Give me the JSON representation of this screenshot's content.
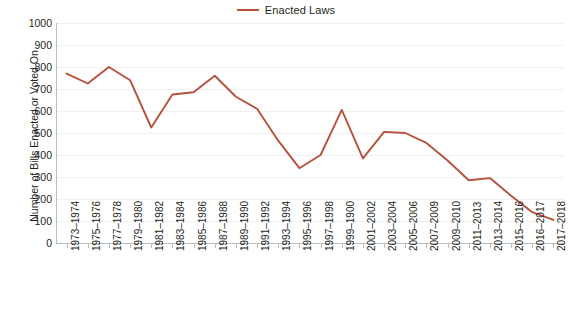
{
  "legend": {
    "entries": [
      {
        "label": "Enacted Laws",
        "color": "#b5513c",
        "marker": "line-swatch"
      }
    ],
    "position": "top-center"
  },
  "axes": {
    "y_title": "Number of Bills Enacted or Voted On",
    "x_title": "",
    "y_ticks": [
      "0",
      "100",
      "200",
      "300",
      "400",
      "500",
      "600",
      "700",
      "800",
      "900",
      "1000"
    ]
  },
  "chart_data": {
    "type": "line",
    "title": "",
    "subtitle": "",
    "xlabel": "",
    "ylabel": "Number of Bills Enacted or Voted On",
    "ylim": [
      0,
      1000
    ],
    "ytick_step": 100,
    "grid": true,
    "legend_position": "top-center",
    "categories": [
      "1973–1974",
      "1975–1976",
      "1977–1978",
      "1979–1980",
      "1981–1982",
      "1983–1984",
      "1985–1986",
      "1987–1988",
      "1989–1990",
      "1991–1992",
      "1993–1994",
      "1995–1996",
      "1997–1998",
      "1999–1900",
      "2001–2002",
      "2003–2004",
      "2005–2006",
      "2007–2009",
      "2009–2010",
      "2011–2013",
      "2013–2014",
      "2015–2016",
      "2016–2017",
      "2017–2018"
    ],
    "series": [
      {
        "name": "Enacted Laws",
        "color": "#b5513c",
        "values": [
          770,
          725,
          800,
          740,
          525,
          675,
          685,
          760,
          665,
          610,
          465,
          340,
          400,
          605,
          385,
          505,
          500,
          455,
          375,
          285,
          295,
          215,
          140,
          105
        ]
      }
    ]
  }
}
